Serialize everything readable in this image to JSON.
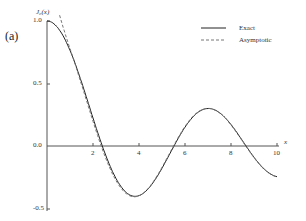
{
  "panel_label": "(a)",
  "chart_data": {
    "type": "line",
    "title": "",
    "xlabel": "x",
    "ylabel": "J_0(x)",
    "xlim": [
      0,
      10
    ],
    "ylim": [
      -0.5,
      1.0
    ],
    "xticks": [
      "2",
      "4",
      "6",
      "8",
      "10"
    ],
    "yticks": [
      "1.0",
      "0.5",
      "0.0",
      "-0.5"
    ],
    "grid": false,
    "legend_position": "upper right",
    "series": [
      {
        "name": "Exact",
        "style": "solid",
        "x": [
          0,
          1,
          2,
          2.405,
          3,
          3.83,
          4,
          5,
          5.52,
          6,
          7,
          7.02,
          8,
          8.65,
          9,
          10
        ],
        "values": [
          1.0,
          0.765,
          0.224,
          0.0,
          -0.26,
          -0.403,
          -0.397,
          -0.178,
          0.0,
          0.151,
          0.3,
          0.3,
          0.172,
          0.0,
          -0.09,
          -0.246
        ]
      },
      {
        "name": "Asymptotic",
        "style": "dashed",
        "x": [
          0.5,
          1,
          2,
          3,
          4,
          5,
          6,
          7,
          8,
          9,
          10
        ],
        "values": [
          1.13,
          0.81,
          0.23,
          -0.26,
          -0.4,
          -0.18,
          0.15,
          0.3,
          0.17,
          -0.09,
          -0.25
        ]
      }
    ]
  },
  "legend": {
    "exact": "Exact",
    "asymptotic": "Asymptotic"
  },
  "axis": {
    "ylabel": "J₀(x)",
    "xlabel": "x"
  }
}
